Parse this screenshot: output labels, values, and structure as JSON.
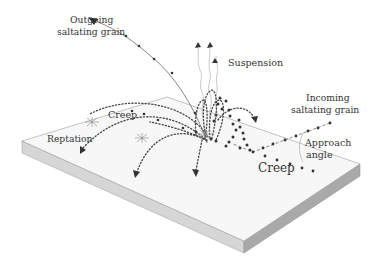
{
  "diagram": {
    "labels": {
      "outgoing": [
        "Outgoing",
        "saltating grain"
      ],
      "suspension": "Suspension",
      "incoming": [
        "Incoming",
        "saltating grain"
      ],
      "approach": [
        "Approach",
        "angle"
      ],
      "creep_left": "Creep",
      "creep_right": "Creep",
      "reptation": "Reptation"
    },
    "colors": {
      "slab_top": "#f7f7f7",
      "slab_left_side": "#d6d6d6",
      "slab_right_side": "#a9a9a9",
      "slab_edge": "#9a9a9a",
      "ink": "#333333",
      "wisp": "#bbbbbb"
    },
    "icons": {
      "trajectory_arrowhead": "arrowhead-icon",
      "splash_marker": "impact-star-icon",
      "grain": "grain-dot-icon"
    }
  }
}
